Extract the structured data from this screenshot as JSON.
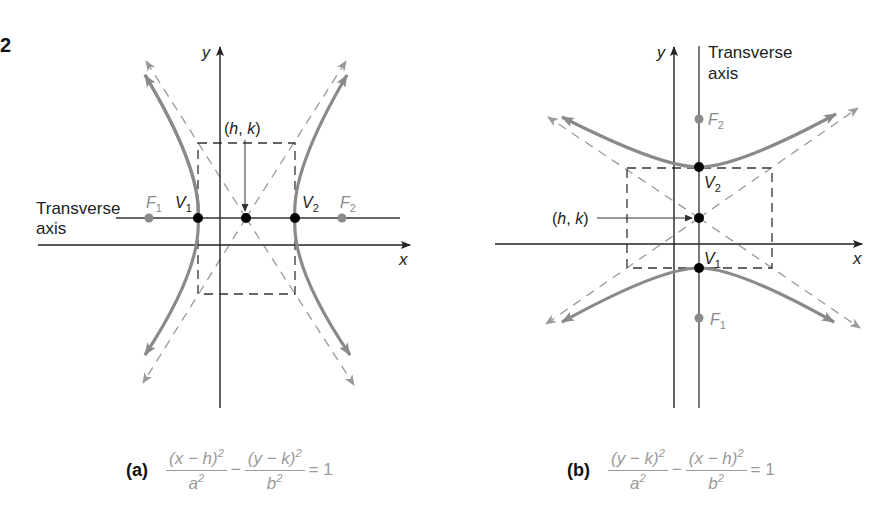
{
  "figure_number": "2",
  "colors": {
    "axis": "#222222",
    "curve": "#8a8a8a",
    "asymptote": "#9a9a9a",
    "box": "#333333",
    "vertex": "#000000",
    "focus": "#8a8a8a",
    "equation": "#9a9a9a"
  },
  "panel_a": {
    "tag": "(a)",
    "axis_x_label": "x",
    "axis_y_label": "y",
    "transverse_label_line1": "Transverse",
    "transverse_label_line2": "axis",
    "center_label": "(h, k)",
    "v1": "V",
    "v1_sub": "1",
    "v2": "V",
    "v2_sub": "2",
    "f1": "F",
    "f1_sub": "1",
    "f2": "F",
    "f2_sub": "2",
    "equation": {
      "num1": "(x − h)",
      "num1_exp": "2",
      "den1": "a",
      "den1_exp": "2",
      "minus": "−",
      "num2": "(y − k)",
      "num2_exp": "2",
      "den2": "b",
      "den2_exp": "2",
      "rhs": "= 1"
    }
  },
  "panel_b": {
    "tag": "(b)",
    "axis_x_label": "x",
    "axis_y_label": "y",
    "transverse_label_line1": "Transverse",
    "transverse_label_line2": "axis",
    "center_label": "(h, k)",
    "v1": "V",
    "v1_sub": "1",
    "v2": "V",
    "v2_sub": "2",
    "f1": "F",
    "f1_sub": "1",
    "f2": "F",
    "f2_sub": "2",
    "equation": {
      "num1": "(y − k)",
      "num1_exp": "2",
      "den1": "a",
      "den1_exp": "2",
      "minus": "−",
      "num2": "(x − h)",
      "num2_exp": "2",
      "den2": "b",
      "den2_exp": "2",
      "rhs": "= 1"
    }
  }
}
